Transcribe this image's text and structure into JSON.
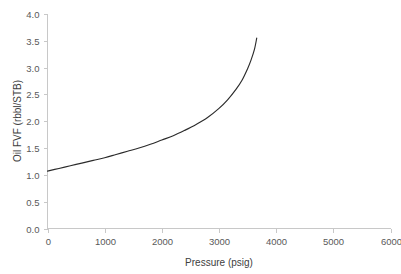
{
  "chart_data": {
    "type": "line",
    "title": "",
    "subtitle": "",
    "xlabel": "Pressure (psig)",
    "ylabel": "Oil FVF (rbbl/STB)",
    "xlim": [
      0,
      6000
    ],
    "ylim": [
      0.0,
      4.0
    ],
    "xticks": [
      0,
      1000,
      2000,
      3000,
      4000,
      5000,
      6000
    ],
    "xtick_labels": [
      "0",
      "1000",
      "2000",
      "3000",
      "4000",
      "5000",
      "6000"
    ],
    "yticks": [
      0.0,
      0.5,
      1.0,
      1.5,
      2.0,
      2.5,
      3.0,
      3.5,
      4.0
    ],
    "ytick_labels": [
      "0.0",
      "0.5",
      "1.0",
      "1.5",
      "2.0",
      "2.5",
      "3.0",
      "3.5",
      "4.0"
    ],
    "grid": false,
    "legend": false,
    "legend_position": "none",
    "line_color": "#2b2b2b",
    "background_color": "#ffffff",
    "axis_color": "#c8c8c8",
    "series": [
      {
        "name": "Oil FVF",
        "x": [
          0,
          200,
          400,
          600,
          800,
          1000,
          1200,
          1400,
          1600,
          1800,
          2000,
          2200,
          2400,
          2600,
          2800,
          3000,
          3150,
          3300,
          3400,
          3500,
          3560,
          3620,
          3660
        ],
        "y": [
          1.07,
          1.12,
          1.17,
          1.22,
          1.27,
          1.32,
          1.38,
          1.44,
          1.5,
          1.57,
          1.65,
          1.73,
          1.83,
          1.94,
          2.07,
          2.24,
          2.4,
          2.6,
          2.76,
          2.98,
          3.14,
          3.34,
          3.55
        ]
      }
    ]
  },
  "axes": {
    "x_title": "Pressure (psig)",
    "y_title": "Oil FVF (rbbl/STB)"
  }
}
